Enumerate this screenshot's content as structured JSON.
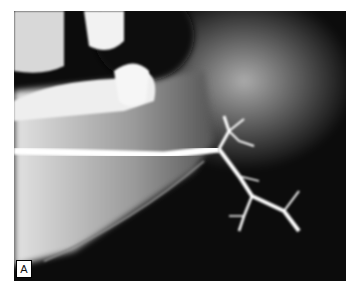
{
  "figure": {
    "panel_label": "A",
    "colors": {
      "background": "#0c0c0c",
      "bone": "#cfcfcf",
      "contrast": "#ffffff",
      "frame": "#ffffff"
    }
  }
}
